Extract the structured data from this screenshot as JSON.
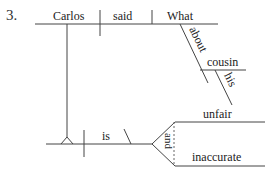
{
  "item_number": "3.",
  "diagram": {
    "type": "sentence-diagram",
    "main_clause": {
      "subject": "Carlos",
      "verb": "said",
      "direct_object_clause_word": "What",
      "modifiers": {
        "preposition": "about",
        "object_of_preposition": "cousin",
        "modifier_of_object": "his"
      }
    },
    "noun_clause": {
      "linking_verb": "is",
      "conjunction": "and",
      "complements": [
        "unfair",
        "inaccurate"
      ]
    }
  }
}
